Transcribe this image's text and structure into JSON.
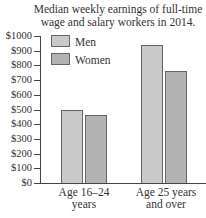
{
  "chart_data": {
    "type": "bar",
    "title": "Median weekly earnings of full-time wage and salary workers in 2014.",
    "title_lines": [
      "Median weekly earnings of full-time",
      "wage and salary workers in 2014."
    ],
    "xlabel": "",
    "ylabel": "",
    "categories": [
      "Age 16–24 years",
      "Age 25 years and over"
    ],
    "category_lines": [
      [
        "Age 16–24",
        "years"
      ],
      [
        "Age 25 years",
        "and over"
      ]
    ],
    "series": [
      {
        "name": "Men",
        "values": [
          500,
          940
        ],
        "color": "#c9c9c9"
      },
      {
        "name": "Women",
        "values": [
          465,
          765
        ],
        "color": "#b3b3b3"
      }
    ],
    "ylim": [
      0,
      1000
    ],
    "yticks": [
      0,
      100,
      200,
      300,
      400,
      500,
      600,
      700,
      800,
      900,
      1000
    ],
    "ytick_labels": [
      "$0",
      "$100",
      "$200",
      "$300",
      "$400",
      "$500",
      "$600",
      "$700",
      "$800",
      "$900",
      "$1000"
    ],
    "legend_position": "upper left inside",
    "grid": false
  }
}
